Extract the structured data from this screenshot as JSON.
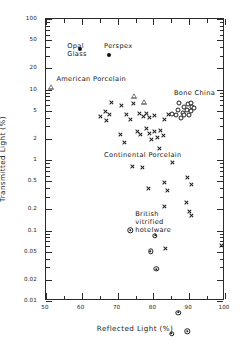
{
  "chart_data": {
    "type": "scatter",
    "title": "",
    "xlabel": "Reflected Light  (%)",
    "ylabel": "Transmitted Light  (%)",
    "xlim": [
      50,
      100
    ],
    "ylim": [
      0.01,
      100
    ],
    "yscale": "log",
    "xscale": "linear",
    "grid": false,
    "legend_position": "inline-annotations",
    "xticks": [
      "50",
      "60",
      "70",
      "80",
      "90",
      "100"
    ],
    "xtick_values": [
      50,
      60,
      70,
      80,
      90,
      100
    ],
    "yticks": [
      "100",
      "50",
      "20",
      "10",
      "5",
      "2",
      "1",
      "0.5",
      "0.2",
      "0.1",
      "0.05",
      "0.02",
      "0.01"
    ],
    "ytick_values": [
      100,
      50,
      20,
      10,
      5,
      2,
      1,
      0.5,
      0.2,
      0.1,
      0.05,
      0.02,
      0.01
    ],
    "annotations": [
      {
        "name": "opal-glass-label",
        "text": "Opal\nGlass",
        "x": 56.2,
        "y": 40
      },
      {
        "name": "perspex-label",
        "text": "Perspex",
        "x": 66.5,
        "y": 40
      },
      {
        "name": "american-porcelain-label",
        "text": "American Porcelain",
        "x": 53.2,
        "y": 13.5
      },
      {
        "name": "bone-china-label",
        "text": "Bone China",
        "x": 86.0,
        "y": 8.6
      },
      {
        "name": "continental-porcelain-label",
        "text": "Continental Porcelain",
        "x": 66.5,
        "y": 1.12
      },
      {
        "name": "british-vitrified-hotelware-label",
        "text": "British\nvitrified\nhotelware",
        "x": 75.2,
        "y": 0.165
      }
    ],
    "series": [
      {
        "name": "Opal Glass",
        "marker": "filled-circle",
        "color": "#121212",
        "points": [
          [
            59.4,
            38.0
          ]
        ]
      },
      {
        "name": "Perspex",
        "marker": "filled-circle",
        "color": "#121212",
        "points": [
          [
            67.6,
            31.0
          ]
        ]
      },
      {
        "name": "American Porcelain",
        "marker": "open-triangle",
        "color": "#1d1d1d",
        "points": [
          [
            51.4,
            11.0
          ],
          [
            74.6,
            9.6
          ],
          [
            77.3,
            9.3
          ]
        ]
      },
      {
        "name": "Bone China",
        "marker": "open-circle",
        "color": "#1d1d1d",
        "points": [
          [
            87.2,
            6.4
          ],
          [
            88.6,
            5.6
          ],
          [
            89.6,
            6.3
          ],
          [
            90.6,
            6.4
          ],
          [
            87.0,
            5.1
          ],
          [
            88.3,
            4.6
          ],
          [
            89.5,
            5.2
          ],
          [
            90.9,
            5.6
          ],
          [
            91.4,
            5.4
          ],
          [
            86.2,
            4.3
          ],
          [
            87.6,
            3.9
          ],
          [
            88.6,
            4.4
          ],
          [
            89.9,
            4.3
          ],
          [
            85.3,
            4.5
          ],
          [
            90.4,
            4.9
          ]
        ]
      },
      {
        "name": "Continental Porcelain",
        "marker": "cross",
        "color": "#1d1d1d",
        "points": [
          [
            68.3,
            6.5
          ],
          [
            71.2,
            6.0
          ],
          [
            74.4,
            6.4
          ],
          [
            66.5,
            4.9
          ],
          [
            67.7,
            4.4
          ],
          [
            65.3,
            4.1
          ],
          [
            66.8,
            3.6
          ],
          [
            72.6,
            4.4
          ],
          [
            73.5,
            3.8
          ],
          [
            76.2,
            4.6
          ],
          [
            77.3,
            4.2
          ],
          [
            78.2,
            4.5
          ],
          [
            79.0,
            4.0
          ],
          [
            80.3,
            4.3
          ],
          [
            84.2,
            4.4
          ],
          [
            83.1,
            3.8
          ],
          [
            70.9,
            2.3
          ],
          [
            71.9,
            1.75
          ],
          [
            75.5,
            2.5
          ],
          [
            76.5,
            2.3
          ],
          [
            78.1,
            2.8
          ],
          [
            79.0,
            2.4
          ],
          [
            80.4,
            2.5
          ],
          [
            81.2,
            2.1
          ],
          [
            82.0,
            2.6
          ],
          [
            82.9,
            2.2
          ],
          [
            79.6,
            1.95
          ],
          [
            81.6,
            1.45
          ],
          [
            74.2,
            0.82
          ],
          [
            77.0,
            0.78
          ],
          [
            85.3,
            0.93
          ],
          [
            83.1,
            0.48
          ],
          [
            78.5,
            0.4
          ],
          [
            84.0,
            0.37
          ],
          [
            89.6,
            0.57
          ],
          [
            90.6,
            0.45
          ],
          [
            83.0,
            0.22
          ],
          [
            89.2,
            0.25
          ],
          [
            90.0,
            0.185
          ],
          [
            90.6,
            0.165
          ],
          [
            83.5,
            0.056
          ],
          [
            98.9,
            0.062
          ]
        ]
      },
      {
        "name": "British vitrified hotelware",
        "marker": "circled-dot",
        "color": "#1d1d1d",
        "points": [
          [
            73.5,
            0.165
          ],
          [
            80.4,
            0.165
          ],
          [
            79.2,
            0.118
          ],
          [
            80.8,
            0.079
          ],
          [
            87.0,
            0.0225
          ],
          [
            85.1,
            0.0135
          ],
          [
            89.5,
            0.0175
          ]
        ]
      }
    ]
  }
}
